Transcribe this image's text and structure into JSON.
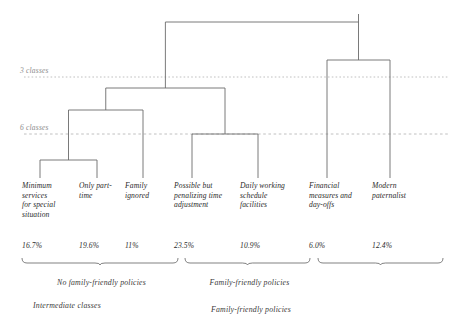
{
  "figure": {
    "type": "dendrogram",
    "width": 465,
    "height": 320,
    "background": "#ffffff",
    "line_color": "#6b6b6b",
    "dash_color": "#b9b9b9",
    "text_color": "#2b2b2b",
    "muted_text_color": "#8c8c8c"
  },
  "cut_lines": [
    {
      "label": "3 classes",
      "y": 77
    },
    {
      "label": "6 classes",
      "y": 134
    }
  ],
  "leaves": [
    {
      "label": "Minimum\nservices\nfor special\nsituation",
      "pct": "16.7%",
      "x": 40
    },
    {
      "label": "Only part-\ntime",
      "pct": "19.6%",
      "x": 97
    },
    {
      "label": "Family\nignored",
      "pct": "11%",
      "x": 143
    },
    {
      "label": "Possible but\npenalizing time\nadjustment",
      "pct": "23.5%",
      "x": 192
    },
    {
      "label": "Daily working\nschedule\nfacilities",
      "pct": "10.9%",
      "x": 258
    },
    {
      "label": "Financial\nmeasures and\nday-offs",
      "pct": "6.0%",
      "x": 327
    },
    {
      "label": "Modern\npaternalist",
      "pct": "12.4%",
      "x": 390
    }
  ],
  "groups": [
    {
      "caption": "No family-friendly policies",
      "from": 22,
      "to": 178
    },
    {
      "caption": "Family-friendly policies",
      "from": 185,
      "to": 310
    },
    {
      "caption": "",
      "from": 318,
      "to": 443
    }
  ],
  "bottom_captions": [
    {
      "text": "Intermediate classes",
      "x": 33,
      "y": 301
    },
    {
      "text": "Family-friendly policies",
      "x": 211,
      "y": 305
    }
  ],
  "chart_data": {
    "type": "dendrogram",
    "title": "",
    "xlabel": "",
    "ylabel": "",
    "leaf_labels": [
      "Minimum services for special situation",
      "Only part-time",
      "Family ignored",
      "Possible but penalizing time adjustment",
      "Daily working schedule facilities",
      "Financial measures and day-offs",
      "Modern paternalist"
    ],
    "leaf_percentages": [
      16.7,
      19.6,
      11.0,
      23.5,
      10.9,
      6.0,
      12.4
    ],
    "leaf_percentage_labels": [
      "16.7%",
      "19.6%",
      "11%",
      "23.5%",
      "10.9%",
      "6.0%",
      "12.4%"
    ],
    "merges": [
      {
        "children": [
          0,
          1
        ],
        "height_px": 160
      },
      {
        "children": [
          5,
          6
        ],
        "height_px": 60
      },
      {
        "children": [
          3,
          4
        ],
        "height_px": 134
      },
      {
        "children": [
          "m0",
          2
        ],
        "height_px": 110
      },
      {
        "children": [
          "m3",
          "m2"
        ],
        "height_px": 88
      },
      {
        "children": [
          "m4",
          "m1"
        ],
        "height_px": 22
      }
    ],
    "cut_lines": [
      {
        "label": "3 classes",
        "y_px": 77
      },
      {
        "label": "6 classes",
        "y_px": 134
      }
    ],
    "groupings": [
      {
        "label": "No family-friendly policies",
        "leaves": [
          0,
          1,
          2
        ]
      },
      {
        "label": "Family-friendly policies",
        "leaves": [
          3,
          4
        ]
      },
      {
        "label": "",
        "leaves": [
          5,
          6
        ]
      }
    ],
    "annotations": [
      "Intermediate classes",
      "Family-friendly policies"
    ],
    "grid": false,
    "legend": "none"
  }
}
